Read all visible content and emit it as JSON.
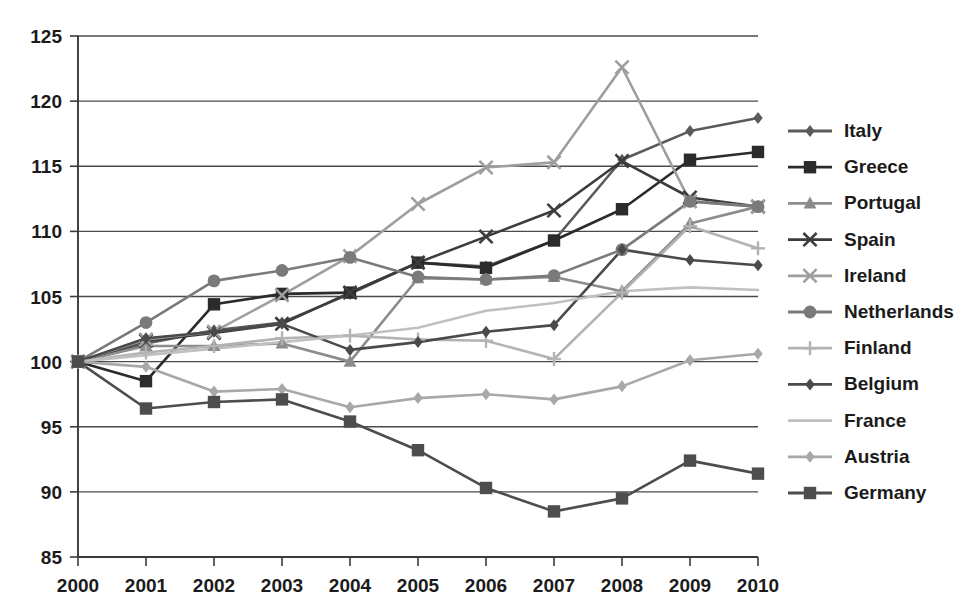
{
  "chart_data": {
    "type": "line",
    "title": "",
    "xlabel": "",
    "ylabel": "",
    "categories": [
      "2000",
      "2001",
      "2002",
      "2003",
      "2004",
      "2005",
      "2006",
      "2007",
      "2008",
      "2009",
      "2010"
    ],
    "x": [
      2000,
      2001,
      2002,
      2003,
      2004,
      2005,
      2006,
      2007,
      2008,
      2009,
      2010
    ],
    "ylim": [
      85,
      125
    ],
    "yticks": [
      85,
      90,
      95,
      100,
      105,
      110,
      115,
      120,
      125
    ],
    "ytick_labels": [
      "85",
      "90",
      "95",
      "100",
      "105",
      "110",
      "115",
      "120",
      "125"
    ],
    "xlim": [
      2000,
      2010
    ],
    "grid": "horizontal",
    "legend_position": "right",
    "series": [
      {
        "name": "Italy",
        "marker": "diamond",
        "color": "#5a5a5a",
        "values": [
          100.0,
          101.4,
          102.4,
          103.0,
          105.2,
          107.6,
          107.3,
          109.3,
          115.5,
          117.7,
          118.7
        ]
      },
      {
        "name": "Greece",
        "marker": "square",
        "color": "#2b2b2b",
        "values": [
          100.0,
          98.5,
          104.4,
          105.2,
          105.3,
          107.6,
          107.2,
          109.3,
          111.7,
          115.5,
          116.1
        ]
      },
      {
        "name": "Portugal",
        "marker": "triangle",
        "color": "#8c8c8c",
        "values": [
          100.0,
          101.2,
          101.2,
          101.4,
          100.0,
          106.4,
          106.3,
          106.5,
          105.4,
          110.6,
          111.9
        ]
      },
      {
        "name": "Spain",
        "marker": "x",
        "color": "#3c3c3c",
        "values": [
          100.0,
          101.6,
          102.2,
          102.9,
          105.3,
          107.6,
          109.6,
          111.6,
          115.4,
          112.6,
          111.9
        ]
      },
      {
        "name": "Ireland",
        "marker": "x",
        "color": "#9e9e9e",
        "values": [
          100.0,
          101.7,
          102.3,
          105.1,
          108.1,
          112.1,
          114.9,
          115.3,
          122.6,
          112.3,
          111.9
        ]
      },
      {
        "name": "Netherlands",
        "marker": "circle",
        "color": "#7a7a7a",
        "values": [
          100.0,
          103.0,
          106.2,
          107.0,
          108.0,
          106.5,
          106.3,
          106.6,
          108.6,
          112.3,
          111.9
        ]
      },
      {
        "name": "Finland",
        "marker": "plus",
        "color": "#b3b3b3",
        "values": [
          100.0,
          100.7,
          101.2,
          101.8,
          102.0,
          101.7,
          101.6,
          100.2,
          105.3,
          110.4,
          108.7
        ]
      },
      {
        "name": "Belgium",
        "marker": "diamond",
        "color": "#4a4a4a",
        "values": [
          100.0,
          101.8,
          102.3,
          102.9,
          100.9,
          101.5,
          102.3,
          102.8,
          108.6,
          107.8,
          107.4
        ]
      },
      {
        "name": "France",
        "marker": "none",
        "color": "#c0c0c0",
        "values": [
          100.0,
          100.5,
          101.0,
          101.5,
          102.0,
          102.6,
          103.9,
          104.5,
          105.4,
          105.7,
          105.5
        ]
      },
      {
        "name": "Austria",
        "marker": "diamond",
        "color": "#a8a8a8",
        "values": [
          100.0,
          99.6,
          97.7,
          97.9,
          96.5,
          97.2,
          97.5,
          97.1,
          98.1,
          100.1,
          100.6
        ]
      },
      {
        "name": "Germany",
        "marker": "square",
        "color": "#4d4d4d",
        "values": [
          100.0,
          96.4,
          96.9,
          97.1,
          95.4,
          93.2,
          90.3,
          88.5,
          89.5,
          92.4,
          91.4
        ]
      }
    ]
  },
  "legend": {
    "items": [
      {
        "label": "Italy"
      },
      {
        "label": "Greece"
      },
      {
        "label": "Portugal"
      },
      {
        "label": "Spain"
      },
      {
        "label": "Ireland"
      },
      {
        "label": "Netherlands"
      },
      {
        "label": "Finland"
      },
      {
        "label": "Belgium"
      },
      {
        "label": "France"
      },
      {
        "label": "Austria"
      },
      {
        "label": "Germany"
      }
    ]
  }
}
